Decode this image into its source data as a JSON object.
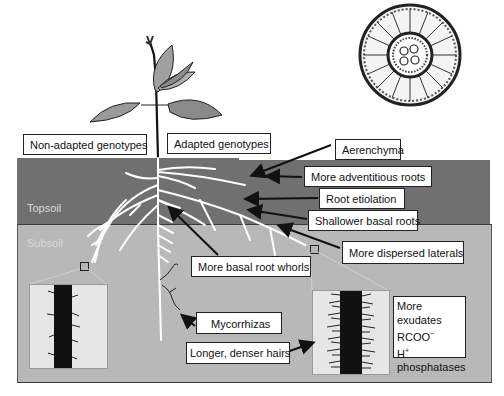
{
  "diagram": {
    "zones": {
      "topsoil": "Topsoil",
      "subsoil": "Subsoil"
    },
    "headers": {
      "non_adapted": "Non-adapted genotypes",
      "adapted": "Adapted genotypes"
    },
    "labels": {
      "aerenchyma": "Aerenchyma",
      "adventitious": "More adventitious roots",
      "etiolation": "Root etiolation",
      "shallower": "Shallower basal roots",
      "dispersed": "More dispersed laterals",
      "whorls": "More basal root whorls",
      "mycorrhizas": "Mycorrhizas",
      "hairs": "Longer, denser hairs",
      "exudates_line1": "More exudates",
      "exudates_line2": "RCOO",
      "exudates_line2_sup": "−",
      "exudates_line3": "H",
      "exudates_line3_sup": "+",
      "exudates_line4": "phosphatases"
    },
    "insets": {
      "root_cross_section": "root-cross-section-illustration",
      "left_root_hair_inset": "sparse-root-hairs-micrograph",
      "right_root_hair_inset": "dense-root-hairs-micrograph"
    },
    "colors": {
      "topsoil": "#707070",
      "subsoil": "#b8b8b8",
      "roots": "#ffffff",
      "box_border": "#222222"
    }
  }
}
